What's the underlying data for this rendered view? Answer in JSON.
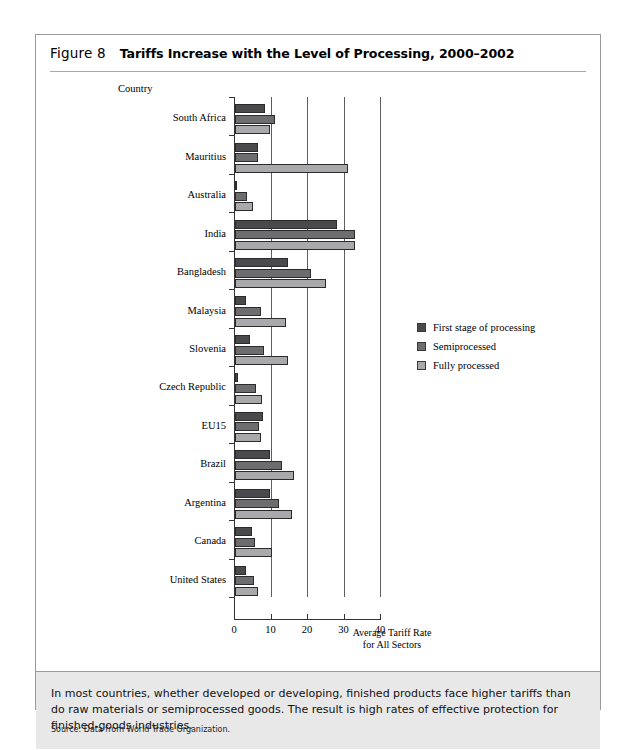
{
  "figure": {
    "number_label": "Figure 8",
    "title": "Tariffs Increase with the Level of Processing, 2000–2002",
    "country_header": "Country",
    "caption": "In most countries, whether developed or developing, finished products face higher tariffs than do raw materials or semiprocessed goods. The result is high rates of effective protection for finished-goods industries.",
    "source": "Source: Data from World Trade Organization."
  },
  "colors": {
    "first_stage": "#4a4a4c",
    "semiprocessed": "#6d6d6f",
    "fully_processed": "#a9a9ab",
    "caption_band": "#e8e8e8",
    "frame": "#9a9a9a",
    "gridline": "#5d5d5d"
  },
  "chart_data": {
    "type": "bar",
    "orientation": "horizontal",
    "title": "Tariffs Increase with the Level of Processing, 2000–2002",
    "xlabel": "Average Tariff Rate for All Sectors",
    "ylabel": "Country",
    "xlim": [
      0,
      40
    ],
    "xticks": [
      0,
      10,
      20,
      30,
      40
    ],
    "xticklabels": [
      "0",
      "10",
      "20",
      "30",
      "40"
    ],
    "grid": "vertical",
    "legend_position": "right",
    "categories": [
      "South Africa",
      "Mauritius",
      "Australia",
      "India",
      "Bangladesh",
      "Malaysia",
      "Slovenia",
      "Czech Republic",
      "EU15",
      "Brazil",
      "Argentina",
      "Canada",
      "United States"
    ],
    "series": [
      {
        "name": "First stage of processing",
        "color": "#4a4a4c",
        "values": [
          8.1,
          6.2,
          0.5,
          28.0,
          14.5,
          3.0,
          4.0,
          0.7,
          7.8,
          9.7,
          9.7,
          4.7,
          3.0
        ]
      },
      {
        "name": "Semiprocessed",
        "color": "#6d6d6f",
        "values": [
          11.0,
          6.2,
          3.4,
          33.0,
          20.7,
          7.0,
          8.0,
          5.7,
          6.5,
          13.0,
          12.0,
          5.5,
          5.2
        ]
      },
      {
        "name": "Fully processed",
        "color": "#a9a9ab",
        "values": [
          9.7,
          31.0,
          4.8,
          33.0,
          25.0,
          14.0,
          14.5,
          7.5,
          7.0,
          16.3,
          15.5,
          10.2,
          6.3
        ]
      }
    ]
  },
  "axis_title_lines": [
    "Average Tariff Rate",
    "for All Sectors"
  ]
}
